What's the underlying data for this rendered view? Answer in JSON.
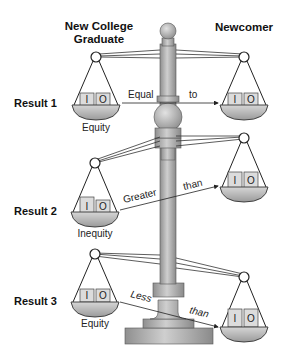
{
  "headers": {
    "left_line1": "New College",
    "left_line2": "Graduate",
    "right": "Newcomer"
  },
  "results": [
    {
      "label": "Result 1",
      "relation_word1": "Equal",
      "relation_word2": "to",
      "outcome": "Equity"
    },
    {
      "label": "Result 2",
      "relation_word1": "Greater",
      "relation_word2": "than",
      "outcome": "Inequity"
    },
    {
      "label": "Result 3",
      "relation_word1": "Less",
      "relation_word2": "than",
      "outcome": "Equity"
    }
  ],
  "box_labels": {
    "input": "I",
    "output": "O"
  },
  "colors": {
    "metal": "#b5b5b5",
    "metal_dark": "#8a8a8a",
    "box": "#d9d9d9",
    "line": "#222222"
  }
}
